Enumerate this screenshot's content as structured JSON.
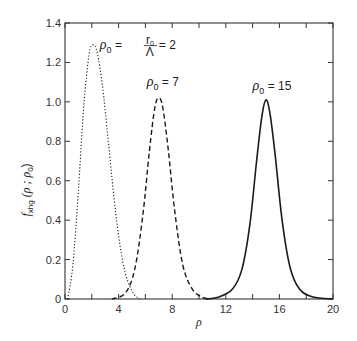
{
  "chart_data": {
    "type": "line",
    "title": "",
    "xlabel": "ρ",
    "ylabel": "f_xhg (ρ ; ρ_0)",
    "xlim": [
      0,
      20
    ],
    "ylim": [
      0,
      1.4
    ],
    "xticks": [
      0,
      4,
      8,
      12,
      16,
      20
    ],
    "xticks_minor": [
      2,
      6,
      10,
      14,
      18
    ],
    "yticks": [
      0,
      0.2,
      0.4,
      0.6,
      0.8,
      1.0,
      1.2,
      1.4
    ],
    "ytick_labels": [
      "0",
      "0.2",
      "0.4",
      "0.6",
      "0.8",
      "1.0",
      "1.2",
      "1.4"
    ],
    "grid": false,
    "legend": "none (inline annotations)",
    "series": [
      {
        "name": "ρ0 = r0/Λ = 2",
        "style": "dotted",
        "x": [
          0.2,
          0.6,
          1.0,
          1.4,
          1.8,
          2.1,
          2.4,
          2.8,
          3.2,
          3.6,
          4.0,
          4.4,
          4.8,
          5.2,
          5.6
        ],
        "y": [
          0.0,
          0.18,
          0.55,
          0.98,
          1.24,
          1.29,
          1.25,
          1.08,
          0.82,
          0.55,
          0.32,
          0.16,
          0.07,
          0.02,
          0.0
        ]
      },
      {
        "name": "ρ0 = 7",
        "style": "dashed",
        "x": [
          3.5,
          4.5,
          5.2,
          5.8,
          6.3,
          6.7,
          7.0,
          7.3,
          7.7,
          8.2,
          8.8,
          9.5,
          10.2,
          10.8
        ],
        "y": [
          0.0,
          0.03,
          0.15,
          0.42,
          0.75,
          0.97,
          1.02,
          0.97,
          0.76,
          0.44,
          0.17,
          0.05,
          0.01,
          0.0
        ]
      },
      {
        "name": "ρ0 = 15",
        "style": "solid",
        "x": [
          10.5,
          11.5,
          12.5,
          13.2,
          13.8,
          14.3,
          14.7,
          15.0,
          15.3,
          15.7,
          16.2,
          16.8,
          17.5,
          18.5,
          20.0
        ],
        "y": [
          0.0,
          0.01,
          0.05,
          0.15,
          0.38,
          0.7,
          0.93,
          1.01,
          0.94,
          0.72,
          0.4,
          0.16,
          0.05,
          0.01,
          0.0
        ]
      }
    ],
    "annotations": [
      {
        "text_main": "ρ",
        "sub": "0",
        "rest": " = ",
        "frac_num": "r",
        "frac_num_sub": "0",
        "frac_den": "Λ",
        "tail": " = 2",
        "x": 2.6,
        "y": 1.27
      },
      {
        "text_main": "ρ",
        "sub": "0",
        "rest": " = 7",
        "x": 6.1,
        "y": 1.08
      },
      {
        "text_main": "ρ",
        "sub": "0",
        "rest": " = 15",
        "x": 14.0,
        "y": 1.06
      }
    ]
  },
  "axis": {
    "xlabel": "ρ",
    "ylabel_main": "f",
    "ylabel_sub": "xhg",
    "ylabel_args": "(ρ ; ρ",
    "ylabel_args_sub": "0",
    "ylabel_close": ")"
  },
  "colors": {
    "line": "#1a1a1a",
    "axis": "#333333"
  }
}
